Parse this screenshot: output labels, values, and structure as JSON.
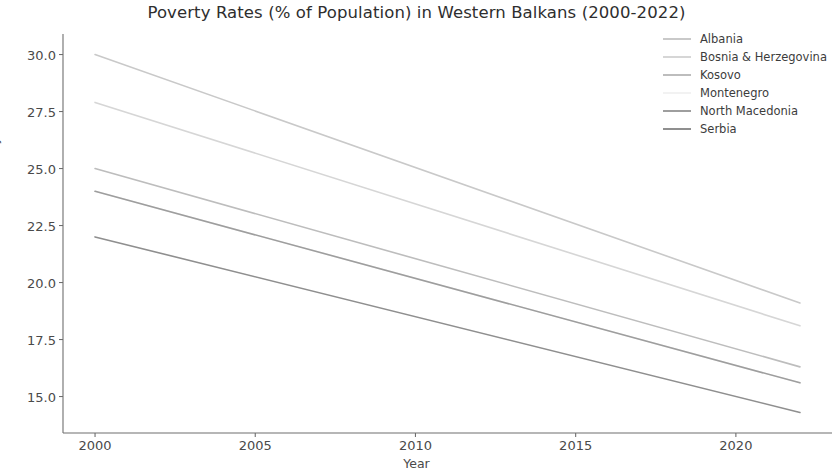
{
  "chart_data": {
    "type": "line",
    "title": "Poverty Rates (% of Population) in Western Balkans (2000-2022)",
    "xlabel": "Year",
    "ylabel": "Poverty Rate (%)",
    "xlim": [
      1999.0,
      2023.0
    ],
    "ylim": [
      13.4,
      30.9
    ],
    "xticks": [
      "2000",
      "2005",
      "2010",
      "2015",
      "2020"
    ],
    "xtick_values": [
      2000,
      2005,
      2010,
      2015,
      2020
    ],
    "yticks": [
      "15.0",
      "17.5",
      "20.0",
      "22.5",
      "25.0",
      "27.5",
      "30.0"
    ],
    "ytick_values": [
      15.0,
      17.5,
      20.0,
      22.5,
      25.0,
      27.5,
      30.0
    ],
    "grid": false,
    "legend_position": "upper right",
    "x": [
      2000,
      2022
    ],
    "series": [
      {
        "name": "Albania",
        "values": [
          30.0,
          19.1
        ],
        "color": "#c9c9c9"
      },
      {
        "name": "Bosnia & Herzegovina",
        "values": [
          27.9,
          18.1
        ],
        "color": "#d6d6d6"
      },
      {
        "name": "Kosovo",
        "values": [
          25.0,
          16.3
        ],
        "color": "#bdbdbd"
      },
      {
        "name": "Montenegro",
        "values": [
          24.0,
          15.6
        ],
        "color": "#f2f2f2"
      },
      {
        "name": "North Macedonia",
        "values": [
          24.0,
          15.6
        ],
        "color": "#9e9e9e"
      },
      {
        "name": "Serbia",
        "values": [
          22.0,
          14.3
        ],
        "color": "#8f8f8f"
      }
    ]
  },
  "legend": {
    "items": [
      {
        "label": "Albania"
      },
      {
        "label": "Bosnia & Herzegovina"
      },
      {
        "label": "Kosovo"
      },
      {
        "label": "Montenegro"
      },
      {
        "label": "North Macedonia"
      },
      {
        "label": "Serbia"
      }
    ]
  },
  "axes": {
    "spine_color": "#6e6e6e"
  }
}
